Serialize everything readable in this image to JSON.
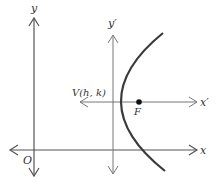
{
  "diagram": {
    "type": "parabola-translated-axes",
    "colors": {
      "axis": "#555555",
      "curve": "#3a3a3a",
      "focus": "#111111",
      "text": "#333333"
    },
    "axes": {
      "x_label": "x",
      "y_label": "y",
      "origin_label": "O",
      "x_prime_label": "x′",
      "y_prime_label": "y′"
    },
    "points": {
      "vertex_label": "V(h, k)",
      "focus_label": "F"
    }
  }
}
